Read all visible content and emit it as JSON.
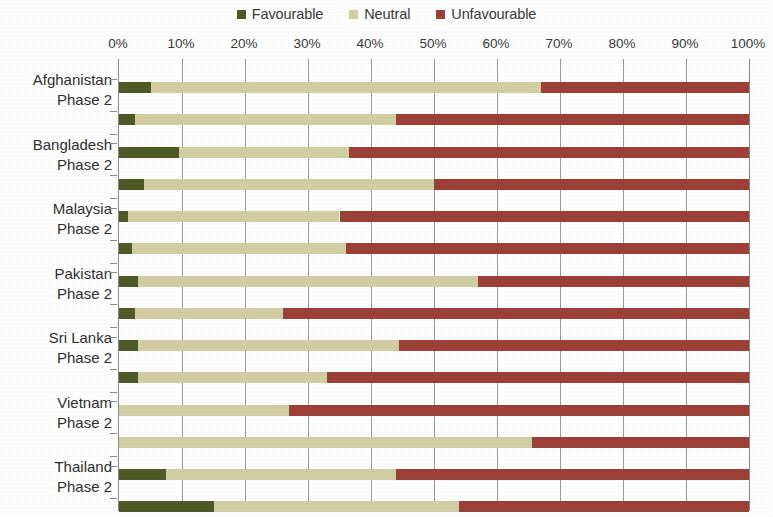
{
  "legend": {
    "position": "top-center",
    "items": [
      {
        "label": "Favourable",
        "color": "#4e5b26",
        "icon": "square-swatch-icon"
      },
      {
        "label": "Neutral",
        "color": "#d3cfa4",
        "icon": "square-swatch-icon"
      },
      {
        "label": "Unfavourable",
        "color": "#9c4038",
        "icon": "square-swatch-icon"
      }
    ]
  },
  "chart_data": {
    "type": "bar",
    "orientation": "horizontal",
    "stacked": true,
    "stack_total": 100,
    "title": "",
    "subtitle": "",
    "xlabel": "",
    "ylabel": "",
    "xlim": [
      0,
      100
    ],
    "grid": true,
    "xticks": [
      0,
      10,
      20,
      30,
      40,
      50,
      60,
      70,
      80,
      90,
      100
    ],
    "tick_labels": [
      "0%",
      "10%",
      "20%",
      "30%",
      "40%",
      "50%",
      "60%",
      "70%",
      "80%",
      "90%",
      "100%"
    ],
    "legend_position": "top-center",
    "series": [
      {
        "name": "Favourable",
        "color": "#4e5b26"
      },
      {
        "name": "Neutral",
        "color": "#d3cfa4"
      },
      {
        "name": "Unfavourable",
        "color": "#9c4038"
      }
    ],
    "groups": [
      {
        "name": "Afghanistan",
        "rows": [
          {
            "label": "Afghanistan",
            "values": [
              5.0,
              62.0,
              33.0
            ]
          },
          {
            "label": "Phase 2",
            "values": [
              2.5,
              41.5,
              56.0
            ]
          }
        ]
      },
      {
        "name": "Bangladesh",
        "rows": [
          {
            "label": "Bangladesh",
            "values": [
              9.5,
              27.0,
              63.5
            ]
          },
          {
            "label": "Phase 2",
            "values": [
              4.0,
              46.0,
              50.0
            ]
          }
        ]
      },
      {
        "name": "Malaysia",
        "rows": [
          {
            "label": "Malaysia",
            "values": [
              1.5,
              33.5,
              65.0
            ]
          },
          {
            "label": "Phase 2",
            "values": [
              2.0,
              34.0,
              64.0
            ]
          }
        ]
      },
      {
        "name": "Pakistan",
        "rows": [
          {
            "label": "Pakistan",
            "values": [
              3.0,
              54.0,
              43.0
            ]
          },
          {
            "label": "Phase 2",
            "values": [
              2.5,
              23.5,
              74.0
            ]
          }
        ]
      },
      {
        "name": "Sri Lanka",
        "rows": [
          {
            "label": "Sri Lanka",
            "values": [
              3.0,
              41.5,
              55.5
            ]
          },
          {
            "label": "Phase 2",
            "values": [
              3.0,
              30.0,
              67.0
            ]
          }
        ]
      },
      {
        "name": "Vietnam",
        "rows": [
          {
            "label": "Vietnam",
            "values": [
              0.0,
              27.0,
              73.0
            ]
          },
          {
            "label": "Phase 2",
            "values": [
              0.0,
              65.5,
              34.5
            ]
          }
        ]
      },
      {
        "name": "Thailand",
        "rows": [
          {
            "label": "Thailand",
            "values": [
              7.5,
              36.5,
              56.0
            ]
          },
          {
            "label": "Phase 2",
            "values": [
              15.0,
              39.0,
              46.0
            ]
          }
        ]
      }
    ]
  }
}
